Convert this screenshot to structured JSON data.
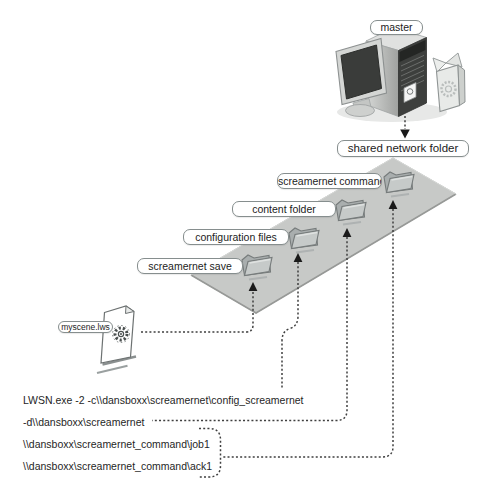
{
  "diagram": {
    "master": {
      "label": "master"
    },
    "shared_folder": {
      "label": "shared network folder"
    },
    "plane_folders": [
      {
        "label": "screamernet save"
      },
      {
        "label": "configuration files"
      },
      {
        "label": "content folder"
      },
      {
        "label": "screamernet command"
      }
    ],
    "scene_file": {
      "label": "myscene.lws"
    },
    "command_lines": [
      "LWSN.exe -2 -c\\\\dansboxx\\screamernet\\config_screamernet",
      "-d\\\\dansboxx\\screamernet",
      "\\\\dansboxx\\screamernet_command\\job1",
      "\\\\dansboxx\\screamernet_command\\ack1"
    ],
    "icons": {
      "master_computer": "computer-tower-with-monitor",
      "shared_plane": "isometric-gray-plane",
      "folder": "open-folder-3d",
      "scene_file": "document-with-gear-logo",
      "connector": "dashed-arrow"
    },
    "colors": {
      "plane_fill": "#c7c9c7",
      "plane_edge_dark": "#979997",
      "connector": "#3f3f3f",
      "arrowhead": "#1a1a1a",
      "label_border": "#868e8e",
      "label_bg": "#ffffff",
      "text": "#1f1f1f",
      "folder_front": "#c6cac9",
      "folder_back": "#a9aeae"
    }
  }
}
